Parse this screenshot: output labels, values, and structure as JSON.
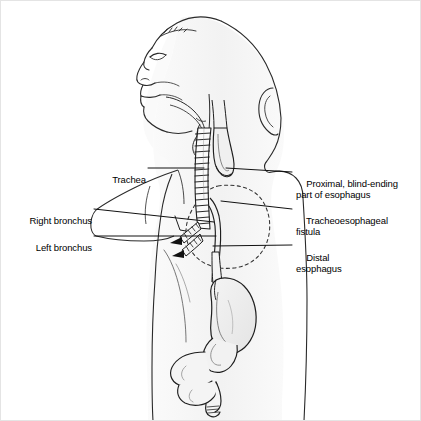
{
  "figure": {
    "view": "lateral sagittal profile of infant head, neck, thorax and abdomen",
    "background_color": "#ffffff",
    "line_color": "#1a1a1a",
    "body_fill_color": "#f5f5f5",
    "organ_fill_color": "#eeeeee",
    "border_color": "#e4e4e4"
  },
  "labels": {
    "left": [
      {
        "id": "trachea",
        "text": "Trachea",
        "text_x": 106,
        "text_y": 163,
        "leader": {
          "x1": 148,
          "y1": 168,
          "x2": 204,
          "y2": 168
        }
      },
      {
        "id": "right-bronchus",
        "text": "Right bronchus",
        "text_x": 18,
        "text_y": 204,
        "leader": {
          "x1": 94,
          "y1": 209,
          "x2": 214,
          "y2": 222
        }
      },
      {
        "id": "left-bronchus",
        "text": "Left bronchus",
        "text_x": 25,
        "text_y": 230,
        "leader": {
          "x1": 94,
          "y1": 236,
          "x2": 216,
          "y2": 236
        }
      }
    ],
    "right": [
      {
        "id": "proximal-pouch",
        "text": "Proximal, blind-ending\npart of esophagus",
        "text_x": 296,
        "text_y": 166,
        "leader": {
          "x1": 292,
          "y1": 172,
          "x2": 226,
          "y2": 168
        }
      },
      {
        "id": "tracheoesophageal-fistula",
        "text": "Tracheoesophageal\nfistula",
        "text_x": 296,
        "text_y": 203,
        "leader": {
          "x1": 292,
          "y1": 209,
          "x2": 221,
          "y2": 201
        }
      },
      {
        "id": "distal-esophagus",
        "text": "Distal\nesophagus",
        "text_x": 296,
        "text_y": 240,
        "leader": {
          "x1": 292,
          "y1": 245,
          "x2": 213,
          "y2": 246
        }
      }
    ]
  },
  "anatomy": {
    "structures": [
      "head-profile",
      "nose",
      "lips",
      "chin",
      "ear",
      "neck",
      "tongue",
      "larynx",
      "trachea",
      "right-bronchus",
      "left-bronchus",
      "lung-outline",
      "proximal-esophageal-pouch",
      "tracheoesophageal-fistula",
      "distal-esophagus",
      "stomach",
      "duodenum",
      "small-intestine",
      "torso-outline",
      "arm-outline"
    ]
  }
}
